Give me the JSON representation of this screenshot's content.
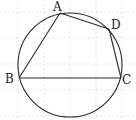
{
  "figure": {
    "type": "geometry",
    "colors": {
      "stroke": "#2a2a2a",
      "grid": "#d8d8d8",
      "background": "#ffffff"
    },
    "circle": {
      "cx": 70,
      "cy": 65,
      "r": 52
    },
    "points": {
      "A": {
        "label": "A",
        "x": 60,
        "y": 13,
        "lx": 53,
        "ly": 11
      },
      "B": {
        "label": "B",
        "x": 19,
        "y": 78,
        "lx": 5,
        "ly": 83
      },
      "C": {
        "label": "C",
        "x": 121,
        "y": 78,
        "lx": 122,
        "ly": 84
      },
      "D": {
        "label": "D",
        "x": 109,
        "y": 29,
        "lx": 111,
        "ly": 29
      }
    },
    "segments": [
      [
        "A",
        "B"
      ],
      [
        "A",
        "D"
      ],
      [
        "D",
        "C"
      ],
      [
        "B",
        "C"
      ]
    ]
  }
}
